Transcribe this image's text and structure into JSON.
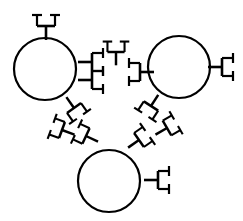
{
  "figure": {
    "background_color": "#ffffff",
    "ink_color": "#000000",
    "width": 243,
    "height": 221,
    "particle_stroke_width": 2.2,
    "antibody_stroke_width": 2.6,
    "antibody_arm_stroke_width": 2.2
  },
  "particles": [
    {
      "name": "particle-top-left",
      "label": "",
      "cx": 45,
      "cy": 69,
      "r": 31
    },
    {
      "name": "particle-top-right",
      "label": "",
      "cx": 179,
      "cy": 67,
      "r": 31
    },
    {
      "name": "particle-bottom",
      "label": "",
      "cx": 109,
      "cy": 181,
      "r": 31
    }
  ],
  "antibodies": [
    {
      "name": "antibody-tl-top",
      "cx": 46,
      "cy": 26,
      "angle": 270,
      "scale": 1.0
    },
    {
      "name": "antibody-tl-right-a",
      "cx": 92,
      "cy": 62,
      "angle": 0,
      "scale": 1.0
    },
    {
      "name": "antibody-tl-right-b",
      "cx": 92,
      "cy": 80,
      "angle": 0,
      "scale": 1.0
    },
    {
      "name": "antibody-bridge-center",
      "cx": 116,
      "cy": 52,
      "angle": 270,
      "scale": 0.95
    },
    {
      "name": "antibody-tr-left",
      "cx": 140,
      "cy": 72,
      "angle": 180,
      "scale": 1.0
    },
    {
      "name": "antibody-tr-right",
      "cx": 222,
      "cy": 67,
      "angle": 0,
      "scale": 1.0
    },
    {
      "name": "antibody-tl-lower-1",
      "cx": 74,
      "cy": 108,
      "angle": 55,
      "scale": 0.95
    },
    {
      "name": "antibody-tl-lower-2",
      "cx": 62,
      "cy": 130,
      "angle": 200,
      "scale": 0.95
    },
    {
      "name": "antibody-bl-bridge",
      "cx": 86,
      "cy": 136,
      "angle": 205,
      "scale": 0.95
    },
    {
      "name": "antibody-tr-lower-1",
      "cx": 151,
      "cy": 106,
      "angle": 123,
      "scale": 0.95
    },
    {
      "name": "antibody-tr-lower-2",
      "cx": 167,
      "cy": 128,
      "angle": 330,
      "scale": 0.95
    },
    {
      "name": "antibody-br-bridge",
      "cx": 139,
      "cy": 140,
      "angle": 325,
      "scale": 0.95
    },
    {
      "name": "antibody-bottom-right",
      "cx": 158,
      "cy": 180,
      "angle": 0,
      "scale": 1.0
    }
  ],
  "legend": {
    "visible": false,
    "entries": []
  },
  "caption": {
    "visible": false,
    "text": ""
  }
}
